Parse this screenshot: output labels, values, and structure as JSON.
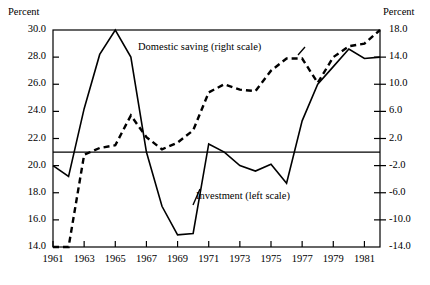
{
  "figure": {
    "left_axis_unit": "Percent",
    "right_axis_unit": "Percent",
    "background_color": "#ffffff",
    "line_color": "#000000"
  },
  "labels": {
    "domestic_saving": "Domestic saving (right scale)",
    "investment": "Investment (left scale)"
  },
  "axes": {
    "left_ticks": [
      "30.0",
      "28.0",
      "26.0",
      "24.0",
      "22.0",
      "20.0",
      "18.0",
      "16.0",
      "14.0"
    ],
    "right_ticks": [
      "18.0",
      "14.0",
      "10.0",
      "6.0",
      "2.0",
      "-2.0",
      "-6.0",
      "-10.0",
      "-14.0"
    ],
    "x_ticks": [
      "1961",
      "1963",
      "1965",
      "1967",
      "1969",
      "1971",
      "1973",
      "1975",
      "1977",
      "1979",
      "1981"
    ]
  },
  "chart_data": {
    "type": "line",
    "title": "",
    "subtitle": "",
    "xlabel": "",
    "ylabel": "Percent",
    "y2label": "Percent",
    "grid": false,
    "legend_position": "inline-annotations",
    "x": [
      1961,
      1962,
      1963,
      1964,
      1965,
      1966,
      1967,
      1968,
      1969,
      1970,
      1971,
      1972,
      1973,
      1974,
      1975,
      1976,
      1977,
      1978,
      1979,
      1980,
      1981,
      1982
    ],
    "xlim": [
      1961,
      1982
    ],
    "ylim_left": [
      14.0,
      30.0
    ],
    "ylim_right": [
      -14.0,
      18.0
    ],
    "reference_line": {
      "left_value": 21.0,
      "right_value": 0.0,
      "style": "solid"
    },
    "series": [
      {
        "name": "Investment (left scale)",
        "axis": "left",
        "style": "solid",
        "units": "Percent",
        "values": [
          20.0,
          19.2,
          24.2,
          28.2,
          30.0,
          28.0,
          21.0,
          17.0,
          14.9,
          15.0,
          21.6,
          21.0,
          20.0,
          19.6,
          20.1,
          18.7,
          23.3,
          26.0,
          27.3,
          28.6,
          27.9,
          28.0
        ]
      },
      {
        "name": "Domestic saving (right scale)",
        "axis": "right",
        "style": "dashed",
        "units": "Percent",
        "values": [
          -14.0,
          -14.0,
          -0.4,
          0.6,
          1.0,
          5.4,
          2.2,
          0.4,
          1.4,
          3.2,
          8.8,
          10.0,
          9.2,
          9.0,
          12.0,
          13.8,
          13.8,
          10.2,
          14.0,
          15.6,
          16.0,
          18.0
        ]
      }
    ]
  }
}
